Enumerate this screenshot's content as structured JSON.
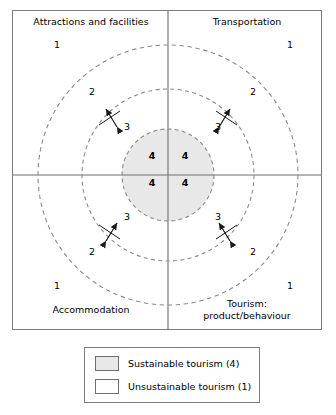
{
  "diagram": {
    "quadrants": [
      {
        "id": "top-left",
        "label": "Attractions and facilities"
      },
      {
        "id": "top-right",
        "label": "Transportation"
      },
      {
        "id": "bottom-left",
        "label": "Accommodation"
      },
      {
        "id": "bottom-right",
        "label": "Tourism:\nproduct/behaviour"
      }
    ],
    "ring_values": {
      "outer": "1",
      "second": "2",
      "third": "3",
      "core": "4"
    },
    "core_labels": [
      "4",
      "4",
      "4",
      "4"
    ],
    "ring_one_labels": [
      "1",
      "1",
      "1",
      "1"
    ],
    "ring_two_labels": [
      "2",
      "2",
      "2",
      "2"
    ],
    "ring_three_labels": [
      "3",
      "3",
      "3",
      "3"
    ],
    "colors": {
      "core_fill": "#e8e8e8",
      "frame_stroke": "#7b7b7b",
      "axis_stroke": "#6e6e6e",
      "dashed_stroke": "#8a8a8a",
      "arrow_stroke": "#1a1a1a",
      "text": "#000000",
      "background": "#ffffff"
    },
    "geometry": {
      "center_x": 168,
      "center_y": 175,
      "radius_core": 46,
      "radius_ring3": 86,
      "radius_ring2": 130
    },
    "arrows": {
      "count": 4,
      "style": "double-headed",
      "description": "bidirectional arrow crossing between ring 2 and ring 3 in each quadrant"
    }
  },
  "legend": {
    "items": [
      {
        "swatch": "#e8e8e8",
        "label": "Sustainable tourism (4)"
      },
      {
        "swatch": "#ffffff",
        "label": "Unsustainable tourism (1)"
      }
    ]
  }
}
